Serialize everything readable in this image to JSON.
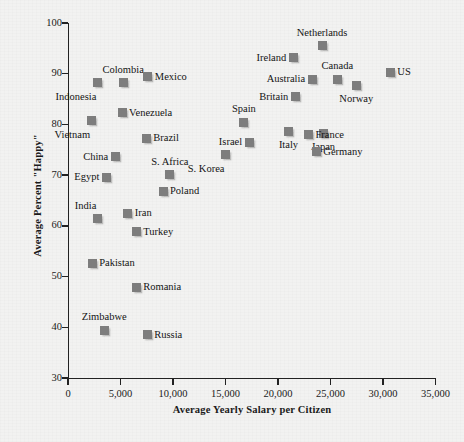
{
  "chart_data": {
    "type": "scatter",
    "title": "",
    "xlabel": "Average Yearly Salary per Citizen",
    "ylabel": "Average Percent \"Happy\"",
    "xlim": [
      0,
      35000
    ],
    "ylim": [
      30,
      100
    ],
    "xticks": [
      0,
      5000,
      10000,
      15000,
      20000,
      25000,
      30000,
      35000
    ],
    "xtick_labels": [
      "0",
      "5,000",
      "10,000",
      "15,000",
      "20,000",
      "25,000",
      "30,000",
      "35,000"
    ],
    "yticks": [
      30,
      40,
      50,
      60,
      70,
      80,
      90,
      100
    ],
    "ytick_labels": [
      "30",
      "40",
      "50",
      "60",
      "70",
      "80",
      "90",
      "100"
    ],
    "grid": false,
    "legend": "none",
    "marker_color": "#7d7d7d",
    "marker_shape": "square",
    "points": [
      {
        "label": "Indonesia",
        "x": 2800,
        "y": 88.2,
        "label_pos": "below-left"
      },
      {
        "label": "Colombia",
        "x": 5250,
        "y": 88.2,
        "label_pos": "above"
      },
      {
        "label": "Mexico",
        "x": 7600,
        "y": 89.4,
        "label_pos": "right"
      },
      {
        "label": "Venezuela",
        "x": 5150,
        "y": 82.3,
        "label_pos": "right"
      },
      {
        "label": "Vietnam",
        "x": 2200,
        "y": 80.7,
        "label_pos": "below-left"
      },
      {
        "label": "Brazil",
        "x": 7450,
        "y": 77.3,
        "label_pos": "right"
      },
      {
        "label": "China",
        "x": 4500,
        "y": 73.6,
        "label_pos": "left"
      },
      {
        "label": "Egypt",
        "x": 3650,
        "y": 69.6,
        "label_pos": "left"
      },
      {
        "label": "S. Africa",
        "x": 9700,
        "y": 70.1,
        "label_pos": "above"
      },
      {
        "label": "Poland",
        "x": 9050,
        "y": 66.8,
        "label_pos": "right"
      },
      {
        "label": "India",
        "x": 2800,
        "y": 61.4,
        "label_pos": "above-left"
      },
      {
        "label": "Iran",
        "x": 5700,
        "y": 62.5,
        "label_pos": "right"
      },
      {
        "label": "Turkey",
        "x": 6500,
        "y": 58.8,
        "label_pos": "right"
      },
      {
        "label": "Pakistan",
        "x": 2300,
        "y": 52.6,
        "label_pos": "right"
      },
      {
        "label": "Romania",
        "x": 6500,
        "y": 47.9,
        "label_pos": "right"
      },
      {
        "label": "Zimbabwe",
        "x": 3450,
        "y": 39.4,
        "label_pos": "above"
      },
      {
        "label": "Russia",
        "x": 7550,
        "y": 38.5,
        "label_pos": "right"
      },
      {
        "label": "S. Korea",
        "x": 15000,
        "y": 74.0,
        "label_pos": "below-left"
      },
      {
        "label": "Israel",
        "x": 17250,
        "y": 76.5,
        "label_pos": "left"
      },
      {
        "label": "Spain",
        "x": 16750,
        "y": 80.4,
        "label_pos": "above"
      },
      {
        "label": "Italy",
        "x": 21000,
        "y": 78.7,
        "label_pos": "below"
      },
      {
        "label": "Japan",
        "x": 24300,
        "y": 78.3,
        "label_pos": "below"
      },
      {
        "label": "Germany",
        "x": 23650,
        "y": 74.6,
        "label_pos": "right"
      },
      {
        "label": "France",
        "x": 22900,
        "y": 78.0,
        "label_pos": "right"
      },
      {
        "label": "Britain",
        "x": 21650,
        "y": 85.5,
        "label_pos": "left"
      },
      {
        "label": "Australia",
        "x": 23250,
        "y": 88.9,
        "label_pos": "left"
      },
      {
        "label": "Canada",
        "x": 25650,
        "y": 88.9,
        "label_pos": "above"
      },
      {
        "label": "Norway",
        "x": 27450,
        "y": 87.7,
        "label_pos": "below"
      },
      {
        "label": "Ireland",
        "x": 21450,
        "y": 93.1,
        "label_pos": "left"
      },
      {
        "label": "Netherlands",
        "x": 24200,
        "y": 95.5,
        "label_pos": "above"
      },
      {
        "label": "US",
        "x": 30700,
        "y": 90.3,
        "label_pos": "right"
      }
    ]
  }
}
